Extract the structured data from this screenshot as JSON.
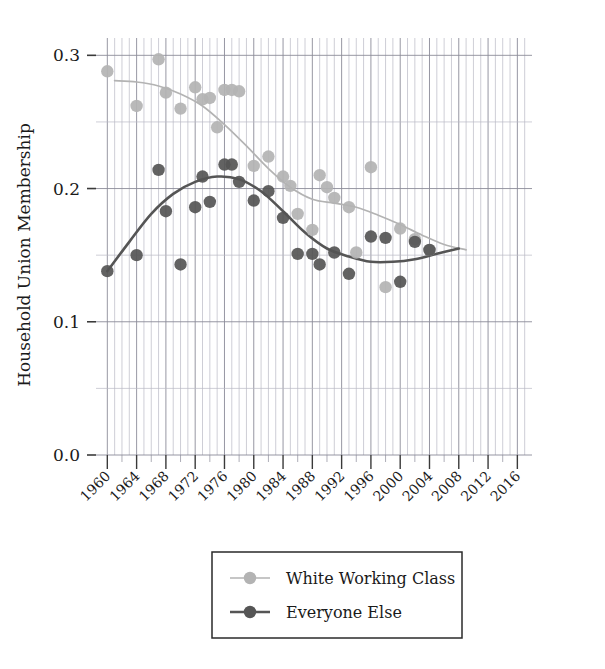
{
  "chart_data": {
    "type": "scatter",
    "title": "",
    "subtitle": "",
    "xlabel": "",
    "ylabel": "Household Union Membership",
    "xlim": [
      1959,
      2018
    ],
    "ylim": [
      0.0,
      0.31
    ],
    "yticks": [
      "0.0",
      "0.1",
      "0.2",
      "0.3"
    ],
    "ytick_values": [
      0.0,
      0.1,
      0.2,
      0.3
    ],
    "xticks": [
      "1960",
      "1964",
      "1968",
      "1972",
      "1976",
      "1980",
      "1984",
      "1988",
      "1992",
      "1996",
      "2000",
      "2004",
      "2008",
      "2012",
      "2016"
    ],
    "xtick_values": [
      1960,
      1964,
      1968,
      1972,
      1976,
      1980,
      1984,
      1988,
      1992,
      1996,
      2000,
      2004,
      2008,
      2012,
      2016
    ],
    "grid": "major and minor vertical gridlines, major horizontal gridlines",
    "grid_color": "#9a9aa8",
    "legend_position": "below-axes-center",
    "series": [
      {
        "name": "White Working Class",
        "color": "#b3b3b3",
        "marker": "circle",
        "points": [
          {
            "x": 1960,
            "y": 0.288
          },
          {
            "x": 1964,
            "y": 0.262
          },
          {
            "x": 1967,
            "y": 0.297
          },
          {
            "x": 1968,
            "y": 0.272
          },
          {
            "x": 1970,
            "y": 0.26
          },
          {
            "x": 1972,
            "y": 0.276
          },
          {
            "x": 1973,
            "y": 0.267
          },
          {
            "x": 1974,
            "y": 0.268
          },
          {
            "x": 1975,
            "y": 0.246
          },
          {
            "x": 1976,
            "y": 0.274
          },
          {
            "x": 1977,
            "y": 0.274
          },
          {
            "x": 1978,
            "y": 0.273
          },
          {
            "x": 1980,
            "y": 0.217
          },
          {
            "x": 1982,
            "y": 0.224
          },
          {
            "x": 1984,
            "y": 0.209
          },
          {
            "x": 1985,
            "y": 0.202
          },
          {
            "x": 1986,
            "y": 0.181
          },
          {
            "x": 1988,
            "y": 0.169
          },
          {
            "x": 1989,
            "y": 0.21
          },
          {
            "x": 1990,
            "y": 0.201
          },
          {
            "x": 1991,
            "y": 0.193
          },
          {
            "x": 1993,
            "y": 0.186
          },
          {
            "x": 1994,
            "y": 0.152
          },
          {
            "x": 1996,
            "y": 0.216
          },
          {
            "x": 1998,
            "y": 0.126
          },
          {
            "x": 2000,
            "y": 0.17
          },
          {
            "x": 2002,
            "y": 0.162
          },
          {
            "x": 2004,
            "y": 0.154
          }
        ],
        "trend": [
          {
            "x": 1961,
            "y": 0.281
          },
          {
            "x": 1964,
            "y": 0.28
          },
          {
            "x": 1967,
            "y": 0.277
          },
          {
            "x": 1970,
            "y": 0.271
          },
          {
            "x": 1973,
            "y": 0.262
          },
          {
            "x": 1976,
            "y": 0.248
          },
          {
            "x": 1979,
            "y": 0.232
          },
          {
            "x": 1982,
            "y": 0.215
          },
          {
            "x": 1985,
            "y": 0.201
          },
          {
            "x": 1988,
            "y": 0.192
          },
          {
            "x": 1991,
            "y": 0.189
          },
          {
            "x": 1994,
            "y": 0.186
          },
          {
            "x": 1997,
            "y": 0.18
          },
          {
            "x": 2000,
            "y": 0.173
          },
          {
            "x": 2003,
            "y": 0.165
          },
          {
            "x": 2006,
            "y": 0.158
          },
          {
            "x": 2009,
            "y": 0.154
          }
        ]
      },
      {
        "name": "Everyone Else",
        "color": "#555555",
        "marker": "circle",
        "points": [
          {
            "x": 1960,
            "y": 0.138
          },
          {
            "x": 1964,
            "y": 0.15
          },
          {
            "x": 1967,
            "y": 0.214
          },
          {
            "x": 1968,
            "y": 0.183
          },
          {
            "x": 1970,
            "y": 0.143
          },
          {
            "x": 1972,
            "y": 0.186
          },
          {
            "x": 1973,
            "y": 0.209
          },
          {
            "x": 1974,
            "y": 0.19
          },
          {
            "x": 1976,
            "y": 0.218
          },
          {
            "x": 1977,
            "y": 0.218
          },
          {
            "x": 1978,
            "y": 0.205
          },
          {
            "x": 1980,
            "y": 0.191
          },
          {
            "x": 1982,
            "y": 0.198
          },
          {
            "x": 1984,
            "y": 0.178
          },
          {
            "x": 1986,
            "y": 0.151
          },
          {
            "x": 1988,
            "y": 0.151
          },
          {
            "x": 1989,
            "y": 0.143
          },
          {
            "x": 1991,
            "y": 0.152
          },
          {
            "x": 1993,
            "y": 0.136
          },
          {
            "x": 1996,
            "y": 0.164
          },
          {
            "x": 1998,
            "y": 0.163
          },
          {
            "x": 2000,
            "y": 0.13
          },
          {
            "x": 2002,
            "y": 0.16
          },
          {
            "x": 2004,
            "y": 0.154
          }
        ],
        "trend": [
          {
            "x": 1960,
            "y": 0.138
          },
          {
            "x": 1963,
            "y": 0.16
          },
          {
            "x": 1966,
            "y": 0.181
          },
          {
            "x": 1969,
            "y": 0.196
          },
          {
            "x": 1972,
            "y": 0.205
          },
          {
            "x": 1975,
            "y": 0.209
          },
          {
            "x": 1978,
            "y": 0.207
          },
          {
            "x": 1981,
            "y": 0.198
          },
          {
            "x": 1984,
            "y": 0.183
          },
          {
            "x": 1987,
            "y": 0.167
          },
          {
            "x": 1990,
            "y": 0.155
          },
          {
            "x": 1993,
            "y": 0.149
          },
          {
            "x": 1996,
            "y": 0.145
          },
          {
            "x": 1999,
            "y": 0.145
          },
          {
            "x": 2002,
            "y": 0.147
          },
          {
            "x": 2005,
            "y": 0.151
          },
          {
            "x": 2008,
            "y": 0.155
          }
        ]
      }
    ]
  },
  "legend": {
    "items": [
      {
        "label": "White Working Class",
        "color": "#b3b3b3"
      },
      {
        "label": "Everyone Else",
        "color": "#555555"
      }
    ]
  },
  "axes": {
    "y_title": "Household Union Membership"
  }
}
